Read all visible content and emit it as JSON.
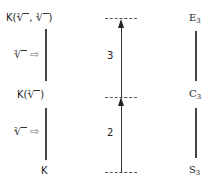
{
  "diagram": {
    "left_column": {
      "top_label": {
        "prefix": "K(",
        "radical1_index": "2",
        "sep": ", ",
        "radical2_index": "3",
        "suffix": ")"
      },
      "middle_label": {
        "prefix": "K(",
        "radical_index": "2",
        "suffix": ")"
      },
      "bottom_label": "K",
      "upper_step": {
        "radical_index": "3",
        "arrow_icon": "hollow-right-arrow",
        "glyph": "⇨"
      },
      "lower_step": {
        "radical_index": "2",
        "arrow_icon": "hollow-right-arrow",
        "glyph": "⇨"
      }
    },
    "middle_column": {
      "upper_degree": "3",
      "lower_degree": "2"
    },
    "right_column": {
      "top": {
        "base": "E",
        "sub": "3"
      },
      "middle": {
        "base": "C",
        "sub": "3"
      },
      "bottom": {
        "base": "S",
        "sub": "3"
      }
    }
  }
}
